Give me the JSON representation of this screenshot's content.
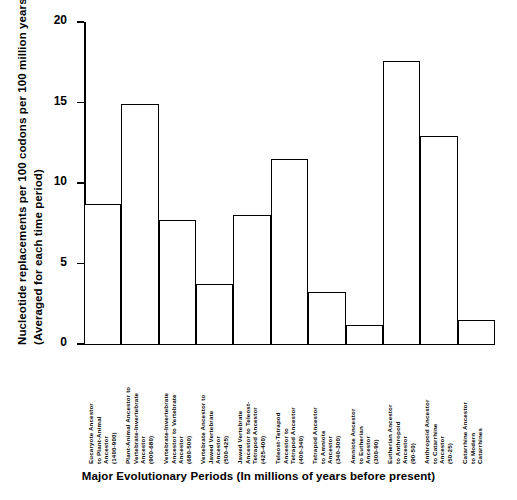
{
  "chart_data": {
    "type": "bar",
    "title": "",
    "xlabel": "Major Evolutionary Periods (In millions of years before present)",
    "ylabel_line1": "Nucleotide replacements per 100 codons per 100 million years",
    "ylabel_line2": "(Averaged for each time period)",
    "ylim": [
      0,
      20
    ],
    "yticks": [
      0,
      5,
      10,
      15,
      20
    ],
    "ytick_labels": [
      "0",
      "5",
      "10",
      "15",
      "20"
    ],
    "grid": false,
    "legend": "none",
    "categories": [
      "Eucaryote Ancestor\nto Plant-Animal\nAncestor\n(1400-900)",
      "Plant-Animal Ancestor to\nVertebrate-Invertebrate\nAncestor\n(900-680)",
      "Vertebrate-Invertebrate\nAncestor to Vertebrate\nAncestor\n(680-500)",
      "Vertebrate Ancestor to\nJawed Vertebrate\nAncestor\n(500-425)",
      "Jawed Vertebrate\nAncestor to Teleost-\nTetrapod Ancestor\n(425-400)",
      "Teleost-Tetrapod\nAncestor to\nTetrapod Ancestor\n(400-340)",
      "Tetrapod Ancestor\nto Amniote\nAncestor\n(340-300)",
      "Amniote Ancestor\nto Eutherian\nAncestor\n(300-90)",
      "Eutherian Ancestor\nto Anthropoid\nAncestor\n(90-50)",
      "Anthropoid Ancestor\nto Catarrhine\nAncestor\n(50-25)",
      "Catarrhine Ancestor\nto Modern\nCatarrhines"
    ],
    "values": [
      8.7,
      14.9,
      7.7,
      3.7,
      8.0,
      11.5,
      3.2,
      1.2,
      17.6,
      12.9,
      1.5
    ],
    "bar_color": "#ffffff",
    "bar_edge_color": "#000000",
    "axis_color": "#000000",
    "background": "#ffffff"
  }
}
